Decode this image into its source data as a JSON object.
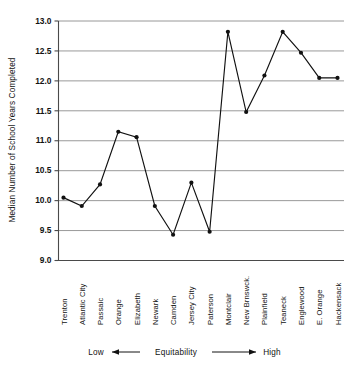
{
  "chart_data": {
    "type": "line",
    "title": "",
    "xlabel": "Equitability",
    "ylabel": "Median Number of School Years Completed",
    "ylim": [
      9.0,
      13.0
    ],
    "ytick_labels": [
      "13.0",
      "12.5",
      "12.0",
      "11.5",
      "11.0",
      "10.5",
      "10.0",
      "9.5",
      "9.0"
    ],
    "ytick_values": [
      13.0,
      12.5,
      12.0,
      11.5,
      11.0,
      10.5,
      10.0,
      9.5,
      9.0
    ],
    "grid": true,
    "legend": "none",
    "categories": [
      "Trenton",
      "Atlantic City",
      "Passaic",
      "Orange",
      "Elizabeth",
      "Newark",
      "Camden",
      "Jersey City",
      "Paterson",
      "Montclair",
      "New Brnswck.",
      "Plainfield",
      "Teaneck",
      "Englewood",
      "E. Orange",
      "Hackensack"
    ],
    "values": [
      10.05,
      9.91,
      10.27,
      11.15,
      11.06,
      9.91,
      9.43,
      10.3,
      9.48,
      12.82,
      11.48,
      12.09,
      12.82,
      12.47,
      12.05,
      12.05
    ],
    "markers": "filled-circle",
    "series_color": "#111111"
  },
  "axis_caption": {
    "low_label": "Low",
    "center_label": "Equitability",
    "high_label": "High"
  },
  "colors": {
    "grid": "#8d8d8d",
    "axis": "#4a4a4a",
    "line": "#111111",
    "text": "#121212",
    "background": "#ffffff"
  }
}
